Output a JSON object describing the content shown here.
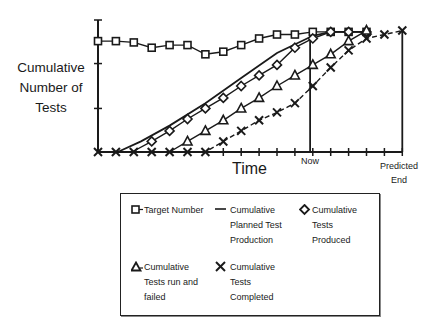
{
  "chart_data": {
    "type": "line",
    "title": "",
    "ylabel": "Cumulative Number of Tests",
    "xlabel": "Time",
    "x_annotations": [
      {
        "label": "Now",
        "x": 11.85
      },
      {
        "label": "Predicted End",
        "x": 17
      }
    ],
    "xlim": [
      0,
      17
    ],
    "ylim": [
      0,
      100
    ],
    "y_ticks": [
      0,
      33,
      67,
      100
    ],
    "x_ticks": [
      0,
      1,
      2,
      3,
      4,
      5,
      6,
      7,
      8,
      9,
      10,
      11,
      12,
      13,
      14,
      15,
      16,
      17
    ],
    "grid": false,
    "legend_position": "below",
    "series": [
      {
        "name": "Target Number",
        "marker": "square",
        "style": "solid",
        "x": [
          0,
          1,
          2,
          3,
          4,
          5,
          6,
          7,
          8,
          9,
          10,
          11,
          12,
          13,
          14,
          15
        ],
        "y": [
          84,
          84,
          83,
          79,
          81,
          81,
          74,
          76,
          81,
          86,
          89,
          89,
          91,
          91,
          91,
          91
        ]
      },
      {
        "name": "Cumulative Planned Test Production",
        "marker": "none",
        "style": "solid",
        "x": [
          1.1,
          2.4,
          4,
          6,
          8,
          10,
          12,
          13,
          15
        ],
        "y": [
          0,
          8,
          20,
          37,
          56,
          75,
          88,
          91,
          91
        ]
      },
      {
        "name": "Cumulative Tests Produced",
        "marker": "diamond",
        "style": "solid",
        "x": [
          1.9,
          3,
          4,
          5,
          6,
          7,
          8,
          9,
          10,
          11,
          12,
          13,
          14,
          15
        ],
        "y": [
          0,
          8,
          16,
          25,
          33,
          41,
          50,
          58,
          66,
          79,
          86,
          91,
          91,
          91
        ],
        "marker_start": 1
      },
      {
        "name": "Cumulative Tests run and failed",
        "marker": "triangle",
        "style": "solid",
        "x": [
          4,
          5,
          6,
          7,
          8,
          9,
          10,
          11,
          12,
          13,
          14,
          15
        ],
        "y": [
          0,
          8,
          16,
          24,
          33,
          41,
          50,
          58,
          66,
          74,
          84,
          92
        ],
        "marker_start": 1
      },
      {
        "name": "Cumulative Tests Completed",
        "marker": "x",
        "style": "dashed",
        "x": [
          0,
          1,
          2,
          3,
          4,
          5,
          6,
          7,
          8,
          9,
          10,
          11,
          12,
          13,
          14,
          15,
          16,
          17
        ],
        "y": [
          0,
          0,
          0,
          0,
          0,
          0,
          0,
          8,
          16,
          24,
          30,
          37,
          50,
          64,
          77,
          86,
          89,
          92
        ]
      }
    ]
  },
  "labels": {
    "y_axis": [
      "Cumulative",
      "Number of",
      "Tests"
    ],
    "x_axis": "Time",
    "now": "Now",
    "predicted": "Predicted",
    "end": "End"
  },
  "legend": {
    "items": [
      {
        "symbol": "square",
        "lines": [
          "Target Number"
        ]
      },
      {
        "symbol": "line",
        "lines": [
          "Cumulative",
          "Planned Test",
          "Production"
        ]
      },
      {
        "symbol": "diamond",
        "lines": [
          "Cumulative",
          "Tests",
          "Produced"
        ]
      },
      {
        "symbol": "triangle",
        "lines": [
          "Cumulative",
          "Tests run and",
          "failed"
        ]
      },
      {
        "symbol": "x",
        "lines": [
          "Cumulative",
          "Tests",
          "Completed"
        ]
      }
    ]
  },
  "colors": {
    "ink": "#1a1a1a",
    "background": "#ffffff"
  }
}
